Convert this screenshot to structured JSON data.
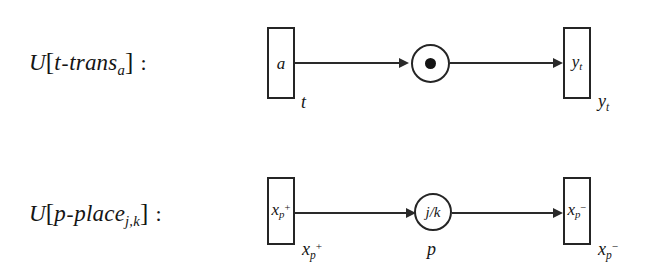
{
  "figure": {
    "background_color": "#ffffff",
    "ink_color": "#1a1a1a",
    "rows": [
      {
        "id": "t-trans",
        "label_prefix": "U",
        "label_open": "[",
        "label_body_a": "t",
        "label_hyphen": "-",
        "label_body_b": "trans",
        "label_subscript": "a",
        "label_close": "]",
        "label_colon": ":",
        "source_box_text": "a",
        "source_box_annotation": "t",
        "place_text": "",
        "place_has_token": true,
        "place_annotation": "",
        "target_box_text_base": "y",
        "target_box_text_sub": "t",
        "target_box_annotation_base": "y",
        "target_box_annotation_sub": "t"
      },
      {
        "id": "p-place",
        "label_prefix": "U",
        "label_open": "[",
        "label_body_a": "p",
        "label_hyphen": "-",
        "label_body_b": "place",
        "label_subscript": "j,k",
        "label_close": "]",
        "label_colon": ":",
        "source_box_text_base": "x",
        "source_box_text_sub": "p",
        "source_box_text_sup": "+",
        "source_box_annotation_base": "x",
        "source_box_annotation_sub": "p",
        "source_box_annotation_sup": "+",
        "place_text": "j/k",
        "place_has_token": false,
        "place_annotation": "p",
        "target_box_text_base": "x",
        "target_box_text_sub": "p",
        "target_box_text_sup": "−",
        "target_box_annotation_base": "x",
        "target_box_annotation_sub": "p",
        "target_box_annotation_sup": "−"
      }
    ]
  }
}
